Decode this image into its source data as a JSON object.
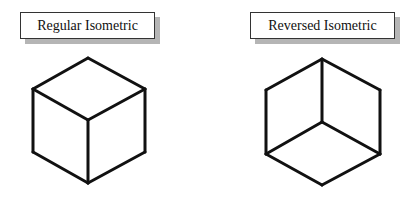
{
  "diagrams": [
    {
      "label": "Regular Isometric",
      "type": "cube",
      "edges": [
        [
          [
            88,
            58
          ],
          [
            33,
            89
          ]
        ],
        [
          [
            88,
            58
          ],
          [
            145,
            89
          ]
        ],
        [
          [
            33,
            89
          ],
          [
            88,
            120
          ]
        ],
        [
          [
            145,
            89
          ],
          [
            88,
            120
          ]
        ],
        [
          [
            33,
            89
          ],
          [
            33,
            152
          ]
        ],
        [
          [
            145,
            89
          ],
          [
            145,
            152
          ]
        ],
        [
          [
            88,
            120
          ],
          [
            88,
            183
          ]
        ],
        [
          [
            33,
            152
          ],
          [
            88,
            183
          ]
        ],
        [
          [
            145,
            152
          ],
          [
            88,
            183
          ]
        ]
      ]
    },
    {
      "label": "Reversed Isometric",
      "type": "cube",
      "edges": [
        [
          [
            322,
            59
          ],
          [
            266,
            90
          ]
        ],
        [
          [
            322,
            59
          ],
          [
            380,
            90
          ]
        ],
        [
          [
            322,
            59
          ],
          [
            322,
            122
          ]
        ],
        [
          [
            266,
            90
          ],
          [
            266,
            154
          ]
        ],
        [
          [
            380,
            90
          ],
          [
            380,
            154
          ]
        ],
        [
          [
            322,
            122
          ],
          [
            266,
            154
          ]
        ],
        [
          [
            322,
            122
          ],
          [
            380,
            154
          ]
        ],
        [
          [
            266,
            154
          ],
          [
            322,
            185
          ]
        ],
        [
          [
            380,
            154
          ],
          [
            322,
            185
          ]
        ]
      ]
    }
  ],
  "style": {
    "stroke": "#111111",
    "stroke_width": 3
  }
}
